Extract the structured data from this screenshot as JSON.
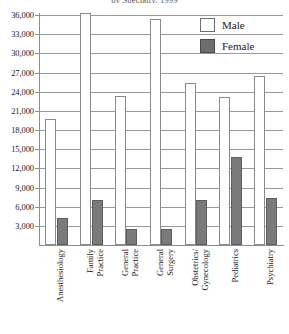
{
  "chart_data": {
    "type": "bar",
    "title": "by Specialty, 1999",
    "xlabel": "",
    "ylabel": "",
    "ylim": [
      0,
      36000
    ],
    "ytick_step": 3000,
    "ytick_labels": [
      "36,000",
      "33,000",
      "30,000",
      "27,000",
      "24,000",
      "21,000",
      "18,000",
      "15,000",
      "12,000",
      "9,000",
      "6,000",
      "3,000"
    ],
    "ytick_values": [
      36000,
      33000,
      30000,
      27000,
      24000,
      21000,
      18000,
      15000,
      12000,
      9000,
      6000,
      3000
    ],
    "grid": true,
    "legend_position": "top-right",
    "categories": [
      "Anesthesiology",
      "Family Practice",
      "General Practice",
      "General Surgery",
      "Obstetrics/ Gynecology",
      "Pediatrics",
      "Psychiatry"
    ],
    "category_lines": [
      [
        "Anesthesiology",
        ""
      ],
      [
        "Family",
        "Practice"
      ],
      [
        "General",
        "Practice"
      ],
      [
        "General",
        "Surgery"
      ],
      [
        "Obstetrics/",
        "Gynecology"
      ],
      [
        "Pediatrics",
        ""
      ],
      [
        "Psychiatry",
        ""
      ]
    ],
    "series": [
      {
        "name": "Male",
        "color": "#ffffff",
        "values": [
          19800,
          36300,
          23300,
          35300,
          25400,
          23200,
          26400
        ]
      },
      {
        "name": "Female",
        "color": "#7a7a7a",
        "values": [
          4200,
          7000,
          2500,
          2500,
          7000,
          13800,
          7400
        ]
      }
    ]
  },
  "legend": {
    "items": [
      {
        "label": "Male",
        "swatch": "male"
      },
      {
        "label": "Female",
        "swatch": "female"
      }
    ]
  }
}
